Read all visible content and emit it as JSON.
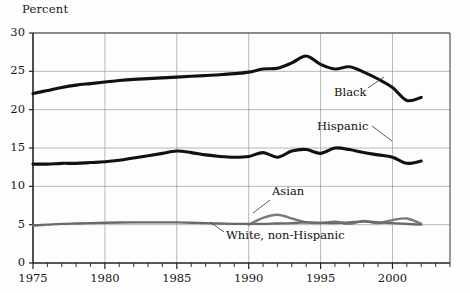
{
  "chart_data": {
    "type": "line",
    "title": "",
    "ylabel": "Percent",
    "xlabel": "",
    "xlim": [
      1975,
      2004
    ],
    "ylim": [
      0,
      30
    ],
    "grid": true,
    "legend_position": "inline-annotations",
    "xticks": [
      1975,
      1980,
      1985,
      1990,
      1995,
      2000
    ],
    "xtick_labels": [
      "1975",
      "1980",
      "1985",
      "1990",
      "1995",
      "2000"
    ],
    "minor_xtick_interval": 1,
    "yticks": [
      0,
      5,
      10,
      15,
      20,
      25,
      30
    ],
    "ytick_labels": [
      "0",
      "5",
      "10",
      "15",
      "20",
      "25",
      "30"
    ],
    "series": [
      {
        "name": "Black",
        "color": "#111111",
        "width": 3.1,
        "x": [
          1975,
          1976,
          1977,
          1978,
          1979,
          1980,
          1981,
          1982,
          1983,
          1984,
          1985,
          1986,
          1987,
          1988,
          1989,
          1990,
          1991,
          1992,
          1993,
          1994,
          1995,
          1996,
          1997,
          1998,
          1999,
          2000,
          2001,
          2002
        ],
        "values": [
          22.1,
          22.5,
          22.9,
          23.2,
          23.4,
          23.6,
          23.8,
          23.95,
          24.05,
          24.15,
          24.25,
          24.35,
          24.45,
          24.55,
          24.7,
          24.9,
          25.3,
          25.4,
          26.1,
          27.0,
          25.9,
          25.3,
          25.6,
          24.9,
          24.0,
          22.9,
          21.2,
          21.6
        ]
      },
      {
        "name": "Hispanic",
        "color": "#111111",
        "width": 3.1,
        "x": [
          1975,
          1976,
          1977,
          1978,
          1979,
          1980,
          1981,
          1982,
          1983,
          1984,
          1985,
          1986,
          1987,
          1988,
          1989,
          1990,
          1991,
          1992,
          1993,
          1994,
          1995,
          1996,
          1997,
          1998,
          1999,
          2000,
          2001,
          2002
        ],
        "values": [
          12.9,
          12.9,
          13.0,
          13.0,
          13.1,
          13.2,
          13.4,
          13.7,
          14.0,
          14.3,
          14.6,
          14.4,
          14.1,
          13.9,
          13.8,
          13.9,
          14.4,
          13.8,
          14.6,
          14.8,
          14.3,
          15.0,
          14.8,
          14.4,
          14.1,
          13.8,
          13.0,
          13.3
        ]
      },
      {
        "name": "Asian",
        "color": "#7a7a7a",
        "width": 2.4,
        "x": [
          1990,
          1991,
          1992,
          1993,
          1994,
          1995,
          1996,
          1997,
          1998,
          1999,
          2000,
          2001,
          2002
        ],
        "values": [
          5.0,
          5.9,
          6.3,
          5.8,
          5.3,
          5.2,
          5.4,
          5.1,
          5.5,
          5.2,
          5.6,
          5.8,
          5.1
        ]
      },
      {
        "name": "White, non-Hispanic",
        "color": "#6a6a6a",
        "width": 2.4,
        "x": [
          1975,
          1976,
          1977,
          1978,
          1979,
          1980,
          1981,
          1982,
          1983,
          1984,
          1985,
          1986,
          1987,
          1988,
          1989,
          1990,
          1991,
          1992,
          1993,
          1994,
          1995,
          1996,
          1997,
          1998,
          1999,
          2000,
          2001,
          2002
        ],
        "values": [
          4.9,
          5.0,
          5.1,
          5.15,
          5.2,
          5.25,
          5.28,
          5.3,
          5.3,
          5.3,
          5.3,
          5.25,
          5.2,
          5.15,
          5.1,
          5.1,
          5.1,
          5.15,
          5.2,
          5.3,
          5.25,
          5.2,
          5.3,
          5.4,
          5.3,
          5.2,
          5.1,
          5.0
        ]
      }
    ],
    "annotations": [
      {
        "text": "Black",
        "x_px": 334,
        "y_px": 93,
        "leader": {
          "x1": 368,
          "y1": 88,
          "x2": 384,
          "y2": 77
        }
      },
      {
        "text": "Hispanic",
        "x_px": 317,
        "y_px": 127,
        "leader": {
          "x1": 372,
          "y1": 126,
          "x2": 392,
          "y2": 141
        }
      },
      {
        "text": "Asian",
        "x_px": 272,
        "y_px": 192,
        "leader": {
          "x1": 270,
          "y1": 200,
          "x2": 253,
          "y2": 213
        }
      },
      {
        "text": "White, non-Hispanic",
        "x_px": 226,
        "y_px": 236,
        "leader": {
          "x1": 224,
          "y1": 232,
          "x2": 210,
          "y2": 222
        }
      }
    ]
  }
}
